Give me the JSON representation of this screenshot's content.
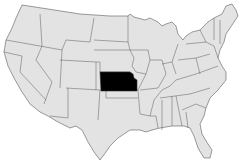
{
  "map": {
    "region": "United States (contiguous 48 states)",
    "highlighted_state": "Kansas",
    "colors": {
      "land": "#e3e3e3",
      "border": "#5a5a5a",
      "highlight": "#000000",
      "background": "#ffffff"
    }
  }
}
